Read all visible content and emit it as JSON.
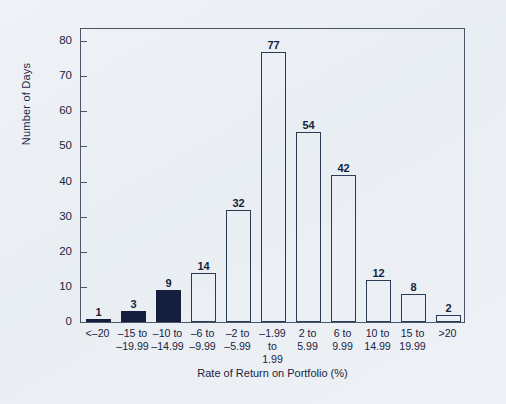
{
  "chart_data": {
    "type": "bar",
    "title": "",
    "xlabel": "Rate of Return on Portfolio (%)",
    "ylabel": "Number of Days",
    "ylim": [
      0,
      84
    ],
    "yticks": [
      0,
      10,
      20,
      30,
      40,
      50,
      60,
      70,
      80
    ],
    "grid": false,
    "legend": null,
    "categories": [
      "<–20",
      "–15 to\n–19.99",
      "–10 to\n–14.99",
      "–6 to\n–9.99",
      "–2 to\n–5.99",
      "–1.99\nto\n1.99",
      "2 to\n5.99",
      "6 to\n9.99",
      "10 to\n14.99",
      "15 to\n19.99",
      ">20"
    ],
    "values": [
      1,
      3,
      9,
      14,
      32,
      77,
      54,
      42,
      12,
      8,
      2
    ],
    "bar_styles": [
      "filled",
      "filled",
      "filled",
      "open",
      "open",
      "open",
      "open",
      "open",
      "open",
      "open",
      "open"
    ],
    "colors": {
      "filled_bar": "#151f3d",
      "bar_outline": "#2b3a55",
      "axis": "#4a5567",
      "text": "#17233f",
      "background": "#eef1f5"
    }
  },
  "axes": {
    "y": {
      "title": "Number of Days",
      "ticks": [
        {
          "label": "0",
          "value": 0
        },
        {
          "label": "10",
          "value": 10
        },
        {
          "label": "20",
          "value": 20
        },
        {
          "label": "30",
          "value": 30
        },
        {
          "label": "40",
          "value": 40
        },
        {
          "label": "50",
          "value": 50
        },
        {
          "label": "60",
          "value": 60
        },
        {
          "label": "70",
          "value": 70
        },
        {
          "label": "80",
          "value": 80
        }
      ]
    },
    "x": {
      "title": "Rate of Return on Portfolio (%)",
      "categories": [
        {
          "lines": [
            "<–20"
          ]
        },
        {
          "lines": [
            "–15 to",
            "–19.99"
          ]
        },
        {
          "lines": [
            "–10 to",
            "–14.99"
          ]
        },
        {
          "lines": [
            "–6 to",
            "–9.99"
          ]
        },
        {
          "lines": [
            "–2 to",
            "–5.99"
          ]
        },
        {
          "lines": [
            "–1.99",
            "to",
            "1.99"
          ]
        },
        {
          "lines": [
            "2 to",
            "5.99"
          ]
        },
        {
          "lines": [
            "6 to",
            "9.99"
          ]
        },
        {
          "lines": [
            "10 to",
            "14.99"
          ]
        },
        {
          "lines": [
            "15 to",
            "19.99"
          ]
        },
        {
          "lines": [
            ">20"
          ]
        }
      ]
    }
  },
  "bar_labels": [
    "1",
    "3",
    "9",
    "14",
    "32",
    "77",
    "54",
    "42",
    "12",
    "8",
    "2"
  ]
}
